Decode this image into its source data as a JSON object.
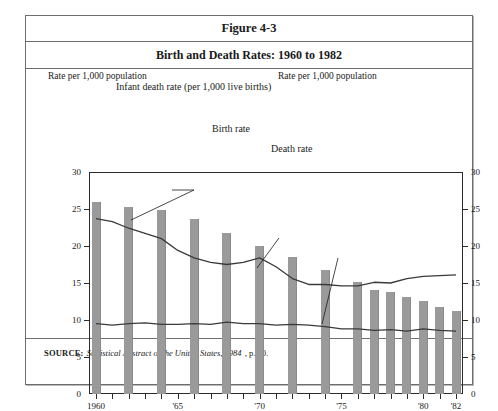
{
  "figure": {
    "number": "Figure 4-3",
    "title": "Birth and Death Rates: 1960 to 1982"
  },
  "source": {
    "label": "SOURCE:",
    "citation": "Statistical Abstract of the United States, 1984",
    "page": ", p. 60."
  },
  "axis_captions": {
    "left": "Rate per 1,000 population",
    "right": "Rate per 1,000 population"
  },
  "chart_data": {
    "type": "bar",
    "title": "Birth and Death Rates: 1960 to 1982",
    "xlabel": "",
    "ylabel": "Rate per 1,000 population",
    "ylim": [
      0,
      30
    ],
    "yticks": [
      0,
      5,
      10,
      15,
      20,
      25,
      30
    ],
    "ytick_labels": [
      "0",
      "5",
      "10",
      "15",
      "20",
      "25",
      "30"
    ],
    "dual_axis": true,
    "grid": false,
    "legend": "annotations",
    "x": [
      1960,
      1961,
      1962,
      1963,
      1964,
      1965,
      1966,
      1967,
      1968,
      1969,
      1970,
      1971,
      1972,
      1973,
      1974,
      1975,
      1976,
      1977,
      1978,
      1979,
      1980,
      1981,
      1982
    ],
    "xtick_positions": [
      1960,
      1965,
      1970,
      1975,
      1980,
      1982
    ],
    "xtick_labels": [
      "1960",
      "'65",
      "'70",
      "'75",
      "'80",
      "'82"
    ],
    "annotations": [
      "Infant death rate (per 1,000 live births)",
      "Birth rate",
      "Death rate"
    ],
    "series": [
      {
        "name": "Infant death rate (per 1,000 live births)",
        "type": "bar",
        "color": "#9a9a9a",
        "x": [
          1960,
          1962,
          1964,
          1966,
          1968,
          1970,
          1972,
          1974,
          1976,
          1977,
          1978,
          1979,
          1980,
          1981,
          1982
        ],
        "values": [
          26.0,
          25.3,
          24.8,
          23.7,
          21.8,
          20.0,
          18.5,
          16.7,
          15.2,
          14.1,
          13.8,
          13.1,
          12.6,
          11.7,
          11.2
        ]
      },
      {
        "name": "Birth rate",
        "type": "line",
        "color": "#3a3a3a",
        "x": [
          1960,
          1961,
          1962,
          1963,
          1964,
          1965,
          1966,
          1967,
          1968,
          1969,
          1970,
          1971,
          1972,
          1973,
          1974,
          1975,
          1976,
          1977,
          1978,
          1979,
          1980,
          1981,
          1982
        ],
        "values": [
          23.7,
          23.3,
          22.4,
          21.7,
          21.0,
          19.4,
          18.4,
          17.8,
          17.5,
          17.8,
          18.4,
          17.2,
          15.6,
          14.8,
          14.8,
          14.6,
          14.6,
          15.1,
          15.0,
          15.6,
          15.9,
          16.0,
          16.1
        ]
      },
      {
        "name": "Death rate",
        "type": "line",
        "color": "#3a3a3a",
        "x": [
          1960,
          1961,
          1962,
          1963,
          1964,
          1965,
          1966,
          1967,
          1968,
          1969,
          1970,
          1971,
          1972,
          1973,
          1974,
          1975,
          1976,
          1977,
          1978,
          1979,
          1980,
          1981,
          1982
        ],
        "values": [
          9.5,
          9.3,
          9.5,
          9.6,
          9.4,
          9.4,
          9.5,
          9.4,
          9.7,
          9.5,
          9.5,
          9.3,
          9.4,
          9.3,
          9.1,
          8.8,
          8.8,
          8.6,
          8.7,
          8.5,
          8.8,
          8.6,
          8.5
        ]
      }
    ]
  }
}
